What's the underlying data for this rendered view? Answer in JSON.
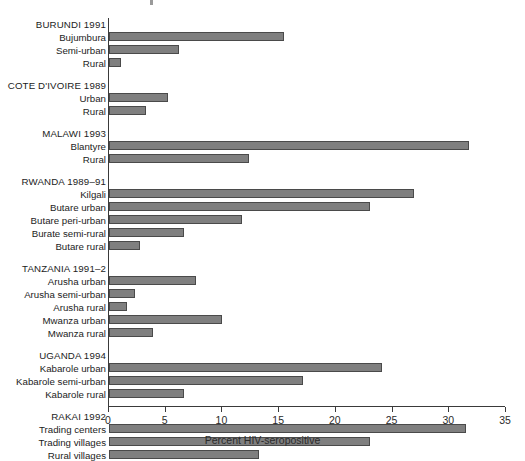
{
  "chart_data": {
    "type": "bar",
    "orientation": "horizontal",
    "title": "",
    "xlabel": "Percent HIV-seropositive",
    "ylabel": "",
    "xlim": [
      0,
      35
    ],
    "xticks": [
      0,
      5,
      10,
      15,
      20,
      25,
      30,
      35
    ],
    "xtick_labels": [
      "0",
      "5",
      "10",
      "15",
      "20",
      "25",
      "30",
      "35"
    ],
    "grid": false,
    "legend": "none",
    "bar_color": "#7f7f7f",
    "bar_edge_color": "#4a4a4a",
    "axis_color": "#3a3a3a",
    "groups": [
      {
        "name": "BURUNDI 1991",
        "categories": [
          "Bujumbura",
          "Semi-urban",
          "Rural"
        ],
        "values": [
          15.4,
          6.2,
          1.1
        ]
      },
      {
        "name": "COTE D'IVOIRE 1989",
        "categories": [
          "Urban",
          "Rural"
        ],
        "values": [
          5.2,
          3.3
        ]
      },
      {
        "name": "MALAWI 1993",
        "categories": [
          "Blantyre",
          "Rural"
        ],
        "values": [
          31.7,
          12.3
        ]
      },
      {
        "name": "RWANDA 1989–91",
        "categories": [
          "Kilgali",
          "Butare urban",
          "Butare peri-urban",
          "Burate semi-rural",
          "Butare rural"
        ],
        "values": [
          26.9,
          23.0,
          11.7,
          6.6,
          2.7
        ]
      },
      {
        "name": "TANZANIA 1991–2",
        "categories": [
          "Arusha urban",
          "Arusha semi-urban",
          "Arusha rural",
          "Mwanza urban",
          "Mwanza rural"
        ],
        "values": [
          7.7,
          2.3,
          1.6,
          10.0,
          3.9
        ]
      },
      {
        "name": "UGANDA 1994",
        "categories": [
          "Kabarole urban",
          "Kabarole semi-urban",
          "Kabarole rural"
        ],
        "values": [
          24.1,
          17.1,
          6.6
        ]
      },
      {
        "name": "RAKAI 1992",
        "categories": [
          "Trading centers",
          "Trading villages",
          "Rural villages"
        ],
        "values": [
          31.5,
          23.0,
          13.2
        ]
      }
    ]
  }
}
